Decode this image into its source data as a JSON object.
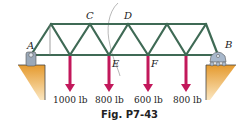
{
  "figure": {
    "caption": "Fig. P7-43",
    "colors": {
      "member": "#3f6a55",
      "load_arrow": "#c2185b",
      "support": "#9aa8b8",
      "ground": "#e8a33a",
      "text": "#222222"
    },
    "joint_labels": {
      "A": "A",
      "B": "B",
      "C": "C",
      "D": "D",
      "E": "E",
      "F": "F"
    },
    "loads": [
      {
        "label": "1000 lb"
      },
      {
        "label": "800 lb"
      },
      {
        "label": "600 lb"
      },
      {
        "label": "800 lb"
      }
    ],
    "supports": {
      "left": "pin support at A",
      "right": "roller support at B"
    }
  }
}
